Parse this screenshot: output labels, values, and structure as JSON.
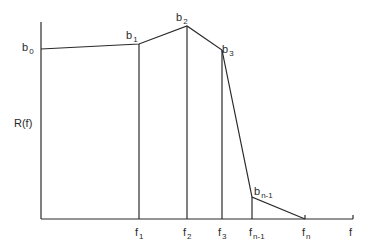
{
  "diagram": {
    "type": "piecewise-linear-function",
    "y_axis_label": "R(f)",
    "x_axis_label": "f",
    "line_color": "#2a2a2a",
    "points": [
      {
        "label": "b",
        "sub": "0",
        "x": 41,
        "y": 49
      },
      {
        "label": "b",
        "sub": "1",
        "x": 139,
        "y": 44
      },
      {
        "label": "b",
        "sub": "2",
        "x": 187,
        "y": 26
      },
      {
        "label": "b",
        "sub": "3",
        "x": 222,
        "y": 50
      },
      {
        "label": "b",
        "sub": "n-1",
        "x": 252,
        "y": 197
      },
      {
        "label": "",
        "sub": "",
        "x": 305,
        "y": 219
      }
    ],
    "x_ticks": [
      {
        "label": "f",
        "sub": "1",
        "x": 139
      },
      {
        "label": "f",
        "sub": "2",
        "x": 187
      },
      {
        "label": "f",
        "sub": "3",
        "x": 222
      },
      {
        "label": "f",
        "sub": "n-1",
        "x": 252
      },
      {
        "label": "f",
        "sub": "n",
        "x": 305
      }
    ],
    "axis": {
      "origin_x": 41,
      "origin_y": 219,
      "y_top": 22,
      "x_end": 353
    }
  }
}
